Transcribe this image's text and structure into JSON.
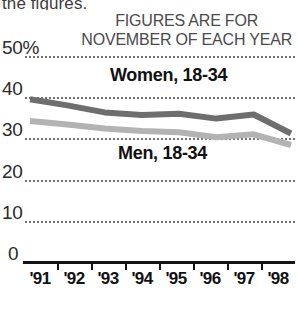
{
  "clipped_caption": "the figures.",
  "header": {
    "line1": "FIGURES ARE FOR",
    "line2": "NOVEMBER OF EACH YEAR"
  },
  "axis": {
    "y_ticks": [
      "50%",
      "40",
      "30",
      "20",
      "10",
      "0"
    ],
    "x_ticks": [
      "'91",
      "'92",
      "'93",
      "'94",
      "'95",
      "'96",
      "'97",
      "'98"
    ]
  },
  "legend": {
    "women": "Women, 18-34",
    "men": "Men, 18-34"
  },
  "colors": {
    "women_line": "#6e6e6e",
    "men_line": "#b3b3b3",
    "grid": "#707070",
    "axis": "#141414",
    "text": "#111111"
  },
  "chart_data": {
    "type": "line",
    "title": "",
    "subtitle": "FIGURES ARE FOR NOVEMBER OF EACH YEAR",
    "xlabel": "",
    "ylabel": "",
    "categories": [
      "'91",
      "'92",
      "'93",
      "'94",
      "'95",
      "'96",
      "'97",
      "'98"
    ],
    "series": [
      {
        "name": "Women, 18-34",
        "color": "#6e6e6e",
        "values": [
          39.5,
          38.0,
          36.3,
          35.7,
          36.0,
          34.8,
          35.8,
          31.2
        ]
      },
      {
        "name": "Men, 18-34",
        "color": "#b3b3b3",
        "values": [
          34.2,
          33.4,
          32.4,
          31.8,
          31.5,
          30.3,
          31.0,
          28.4
        ]
      }
    ],
    "ylim": [
      0,
      50
    ],
    "y_ticks": [
      0,
      10,
      20,
      30,
      40,
      50
    ],
    "y_tick_labels": [
      "0",
      "10",
      "20",
      "30",
      "40",
      "50%"
    ],
    "grid": "horizontal-dotted",
    "legend_position": "inline-annotations"
  }
}
